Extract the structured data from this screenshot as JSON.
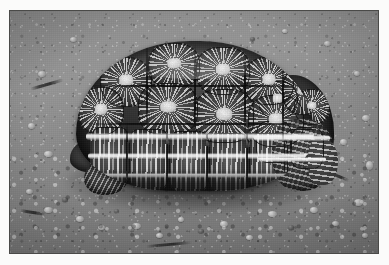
{
  "image": {
    "domain": "Natural-Image",
    "title": "Star tortoise on gravel ground",
    "caption": "",
    "alt_text": "Black and white photograph of a star tortoise with a high domed carapace resting on bare gravelly ground",
    "rendering": "grayscale photograph",
    "frame": {
      "border_color": "#4a4a48",
      "paper_color": "#fbfbfa",
      "border_width_px": 1,
      "photo_left_px": 9,
      "photo_top_px": 10,
      "photo_width_px": 370,
      "photo_height_px": 244
    },
    "palette": {
      "paper": "#fbfbfa",
      "border": "#4a4a48",
      "ground_light": "#96948f",
      "ground_mid": "#8a8883",
      "ground_dark": "#6f6e6a",
      "shell_dark": "#27251f",
      "shell_mid": "#403d39",
      "shell_highlight": "#f2f0ea",
      "shadow": "#191817"
    },
    "subject": {
      "name": "star tortoise",
      "features": [
        "high domed carapace",
        "radiating pale star pattern on each scute",
        "dark brown-black shell ground colour",
        "scaly rear leg visible at right",
        "head tucked toward lower left",
        "front leg visible at lower left"
      ],
      "position": "centred, slightly left of image centre",
      "facing": "toward viewer's left"
    },
    "background": {
      "surface": "bare compacted soil with loose gravel and small pebbles",
      "lighting": "overhead daylight casting a soft shadow under the shell",
      "notable_elements": [
        "scattered light pebbles across the lower third",
        "small dark twig fragments at left and lower centre",
        "fine sandy speckle throughout"
      ]
    }
  }
}
